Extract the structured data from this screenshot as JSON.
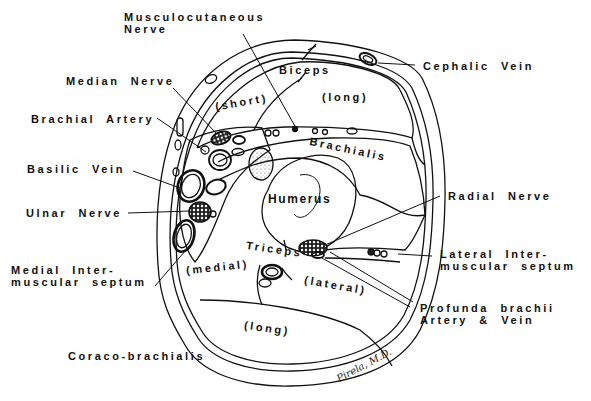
{
  "diagram": {
    "labels": {
      "musculocutaneous_nerve": "Musculocutaneous\nNerve",
      "cephalic_vein": "Cephalic  Vein",
      "median_nerve": "Median  Nerve",
      "biceps": "Biceps",
      "biceps_short": "(short)",
      "biceps_long": "(long)",
      "brachial_artery": "Brachial  Artery",
      "brachialis": "Brachialis",
      "basilic_vein": "Basilic  Vein",
      "humerus": "Humerus",
      "radial_nerve": "Radial  Nerve",
      "ulnar_nerve": "Ulnar  Nerve",
      "triceps": "Triceps",
      "triceps_medial": "(medial)",
      "triceps_lateral": "(lateral)",
      "triceps_long": "(long)",
      "medial_intermuscular_septum": "Medial  Inter-\nmuscular  septum",
      "lateral_intermuscular_septum": "Lateral  Inter-\nmuscular  septum",
      "profunda_brachii": "Profunda  brachii\nArtery  &  Vein",
      "coracobrachialis": "Coraco-brachialis"
    },
    "signature": "Pirela, M.D.",
    "colors": {
      "line": "#111111",
      "background": "#ffffff"
    }
  }
}
